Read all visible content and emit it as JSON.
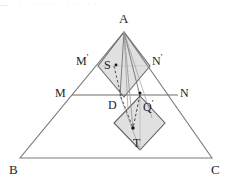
{
  "figure": {
    "type": "geometry-diagram",
    "top_partial_text": "—  ·  ·   ·  ··  ····   ·   ·   ··   ··  ··",
    "colors": {
      "stroke": "#3a3a3a",
      "stroke_light": "#8a8a8a",
      "fill_shade": "#dcdcdc",
      "fill_shade_2": "#e2e2e2",
      "label_text": "#1c1c1c",
      "background": "#ffffff",
      "point_dot": "#111111"
    },
    "labels": [
      {
        "id": "A",
        "text": "A",
        "prime": "",
        "x": 119,
        "y": 12,
        "size": "big"
      },
      {
        "id": "Mp",
        "text": "M",
        "prime": "'",
        "x": 76,
        "y": 53,
        "size": "mid"
      },
      {
        "id": "Np",
        "text": "N",
        "prime": "'",
        "x": 152,
        "y": 53,
        "size": "mid"
      },
      {
        "id": "S",
        "text": "S",
        "prime": "",
        "x": 104,
        "y": 59,
        "size": "mid"
      },
      {
        "id": "M",
        "text": "M",
        "prime": "",
        "x": 55,
        "y": 87,
        "size": "mid"
      },
      {
        "id": "N",
        "text": "N",
        "prime": "",
        "x": 180,
        "y": 87,
        "size": "mid"
      },
      {
        "id": "D",
        "text": "D",
        "prime": "",
        "x": 108,
        "y": 99,
        "size": "mid"
      },
      {
        "id": "Q",
        "text": "Q",
        "prime": "'",
        "x": 143,
        "y": 99,
        "size": "mid"
      },
      {
        "id": "T",
        "text": "T",
        "prime": "",
        "x": 133,
        "y": 137,
        "size": "mid"
      },
      {
        "id": "B",
        "text": "B",
        "prime": "",
        "x": 9,
        "y": 163,
        "size": "big"
      },
      {
        "id": "C",
        "text": "C",
        "prime": "",
        "x": 211,
        "y": 163,
        "size": "big"
      }
    ],
    "points": [
      {
        "id": "A",
        "x": 124,
        "y": 32
      },
      {
        "id": "B",
        "x": 20,
        "y": 158
      },
      {
        "id": "C",
        "x": 212,
        "y": 158
      },
      {
        "id": "M",
        "x": 72,
        "y": 95
      },
      {
        "id": "N",
        "x": 178,
        "y": 95
      },
      {
        "id": "Mprime",
        "x": 98,
        "y": 66
      },
      {
        "id": "Nprime",
        "x": 150,
        "y": 66
      },
      {
        "id": "S",
        "x": 113,
        "y": 66
      },
      {
        "id": "D",
        "x": 120,
        "y": 95
      },
      {
        "id": "Q",
        "x": 140,
        "y": 95
      },
      {
        "id": "T",
        "x": 133,
        "y": 129
      }
    ],
    "rhombus_upper": {
      "top_x": 124,
      "top_y": 32,
      "right_x": 150,
      "right_y": 66,
      "bottom_x": 124,
      "bottom_y": 97,
      "left_x": 98,
      "left_y": 66
    },
    "rhombus_lower": {
      "top_x": 140,
      "top_y": 96,
      "right_x": 165,
      "right_y": 123,
      "bottom_x": 140,
      "bottom_y": 150,
      "left_x": 114,
      "left_y": 123
    },
    "dots": [
      {
        "id": "dot-S",
        "x": 115,
        "y": 65
      },
      {
        "id": "dot-T",
        "x": 133,
        "y": 127
      },
      {
        "id": "dot-Q",
        "x": 140,
        "y": 93
      }
    ]
  }
}
